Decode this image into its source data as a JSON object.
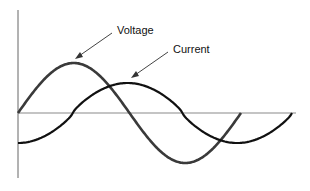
{
  "diagram": {
    "labels": {
      "voltage": "Voltage",
      "current": "Current"
    },
    "series": [
      {
        "name": "Voltage",
        "color": "#3a3a3a",
        "phase_deg": 0,
        "cycles_shown": 1.0
      },
      {
        "name": "Current",
        "color": "#111111",
        "phase_lag_deg": 90,
        "cycles_shown": 1.0
      }
    ],
    "colors": {
      "axis": "#8a8a8a",
      "arrow": "#444444",
      "background": "#ffffff"
    }
  }
}
